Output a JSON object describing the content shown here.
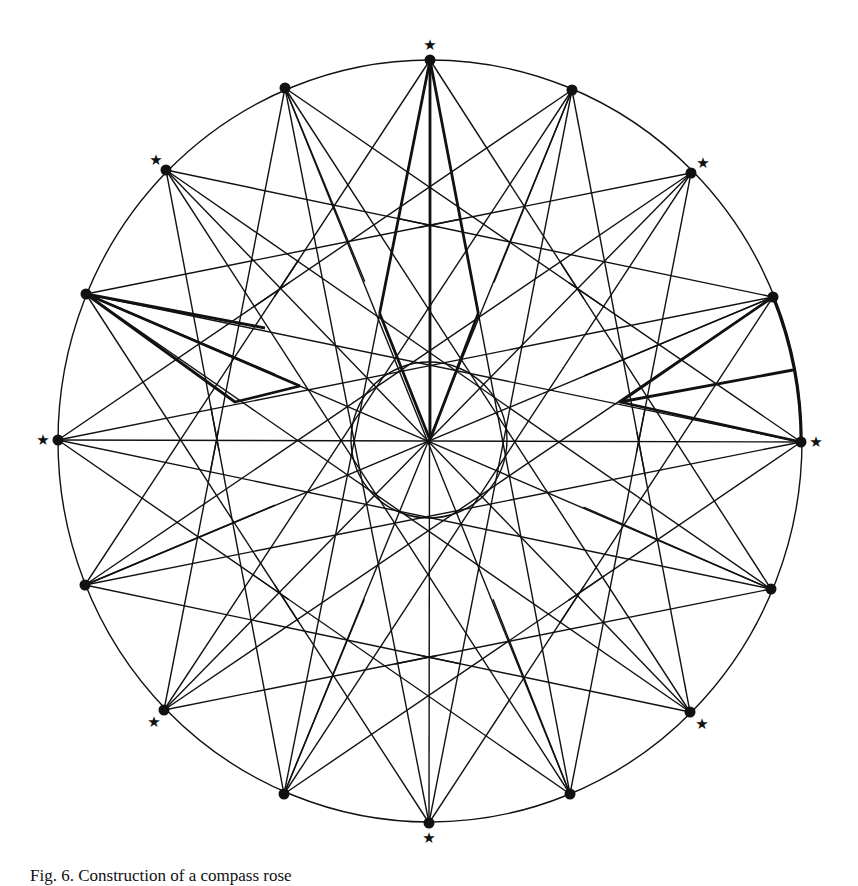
{
  "figure": {
    "caption": "Fig. 6. Construction of a compass rose",
    "stroke_color": "#111111",
    "background": "#ffffff",
    "center": [
      430,
      440
    ],
    "outer_radius": [
      372,
      381
    ],
    "inner_circle_radius": 78,
    "points": {
      "main": [
        {
          "name": "N",
          "xy": [
            430,
            60
          ],
          "star": true
        },
        {
          "name": "NE",
          "xy": [
            691,
            173
          ],
          "star": true
        },
        {
          "name": "E",
          "xy": [
            801,
            442
          ],
          "star": true
        },
        {
          "name": "SE",
          "xy": [
            690,
            712
          ],
          "star": true
        },
        {
          "name": "S",
          "xy": [
            429,
            823
          ],
          "star": true
        },
        {
          "name": "SW",
          "xy": [
            164,
            710
          ],
          "star": true
        },
        {
          "name": "W",
          "xy": [
            58,
            440
          ],
          "star": true
        },
        {
          "name": "NW",
          "xy": [
            166,
            170
          ],
          "star": true
        }
      ],
      "secondary": [
        {
          "name": "NNE",
          "xy": [
            572,
            90
          ]
        },
        {
          "name": "ENE",
          "xy": [
            773,
            297
          ]
        },
        {
          "name": "ESE",
          "xy": [
            771,
            589
          ]
        },
        {
          "name": "SSE",
          "xy": [
            570,
            794
          ]
        },
        {
          "name": "SSW",
          "xy": [
            284,
            794
          ]
        },
        {
          "name": "WSW",
          "xy": [
            85,
            585
          ]
        },
        {
          "name": "WNW",
          "xy": [
            86,
            294
          ]
        },
        {
          "name": "NNW",
          "xy": [
            285,
            88
          ]
        }
      ]
    },
    "star_symbol": "★",
    "highlighted_segments": [
      "north-point",
      "west-north-west-point",
      "east-point"
    ]
  }
}
